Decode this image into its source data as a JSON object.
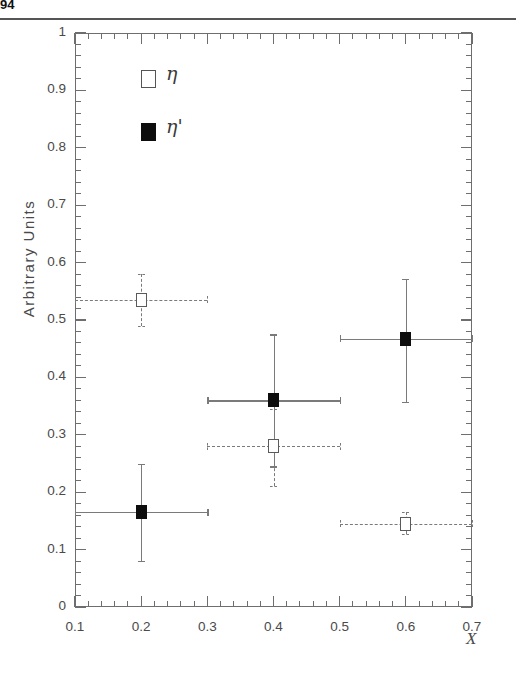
{
  "page": {
    "corner_text": "94",
    "background_color": "#ffffff",
    "rule_color": "#555555"
  },
  "chart_data": {
    "type": "scatter",
    "title": "",
    "xlabel": "X",
    "ylabel": "Arbitrary Units",
    "xlim": [
      0.1,
      0.7
    ],
    "ylim": [
      0,
      1
    ],
    "xticks": [
      0.1,
      0.2,
      0.3,
      0.4,
      0.5,
      0.6,
      0.7
    ],
    "xtick_labels": [
      "0.1",
      "0.2",
      "0.3",
      "0.4",
      "0.5",
      "0.6",
      "0.7"
    ],
    "yticks": [
      0,
      0.1,
      0.2,
      0.3,
      0.4,
      0.5,
      0.6,
      0.7,
      0.8,
      0.9,
      1
    ],
    "ytick_labels": [
      "0",
      "0.1",
      "0.2",
      "0.3",
      "0.4",
      "0.5",
      "0.6",
      "0.7",
      "0.8",
      "0.9",
      "1"
    ],
    "xminor_per_major": 5,
    "yminor_per_major": 5,
    "grid": false,
    "legend_position": "upper-left-inside",
    "series": [
      {
        "name": "eta",
        "label": "η",
        "marker": "open-square",
        "errorbar_style": "dashed",
        "color": "#ffffff",
        "edge_color": "#5a5a5a",
        "points": [
          {
            "x": 0.2,
            "y": 0.535,
            "yerr_low": 0.045,
            "yerr_high": 0.045,
            "xerr_low": 0.1,
            "xerr_high": 0.1
          },
          {
            "x": 0.4,
            "y": 0.28,
            "yerr_low": 0.07,
            "yerr_high": 0.065,
            "xerr_low": 0.1,
            "xerr_high": 0.1
          },
          {
            "x": 0.6,
            "y": 0.145,
            "yerr_low": 0.018,
            "yerr_high": 0.02,
            "xerr_low": 0.1,
            "xerr_high": 0.1
          }
        ]
      },
      {
        "name": "eta-prime",
        "label": "η'",
        "marker": "filled-square",
        "errorbar_style": "solid",
        "color": "#0d0d0d",
        "edge_color": "#0d0d0d",
        "points": [
          {
            "x": 0.2,
            "y": 0.165,
            "yerr_low": 0.085,
            "yerr_high": 0.085,
            "xerr_low": 0.1,
            "xerr_high": 0.1
          },
          {
            "x": 0.4,
            "y": 0.36,
            "yerr_low": 0.115,
            "yerr_high": 0.115,
            "xerr_low": 0.1,
            "xerr_high": 0.1
          },
          {
            "x": 0.6,
            "y": 0.467,
            "yerr_low": 0.11,
            "yerr_high": 0.105,
            "xerr_low": 0.1,
            "xerr_high": 0.1
          }
        ]
      }
    ],
    "legend": [
      {
        "label": "η",
        "marker": "open-square"
      },
      {
        "label": "η'",
        "marker": "filled-square"
      }
    ]
  }
}
